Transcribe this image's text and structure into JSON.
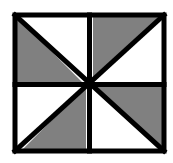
{
  "figure": {
    "name": "pinwheel-square",
    "title": "",
    "caption": "",
    "colors": {
      "shaded": "#808080",
      "unshaded": "#ffffff",
      "stroke": "#000000",
      "background": "#ffffff"
    },
    "geometry": {
      "outer_square": {
        "left": 15,
        "top": 15,
        "right": 164,
        "bottom": 151
      },
      "center": {
        "x": 89.5,
        "y": 83
      },
      "stroke_width": 5,
      "outer_stroke_width": 5
    },
    "quadrants": [
      {
        "id": "top-left",
        "diagonal": "top-left-to-bottom-right",
        "shaded_triangle": "lower-left",
        "unshaded_triangle": "upper-right"
      },
      {
        "id": "top-right",
        "diagonal": "top-right-to-bottom-left",
        "shaded_triangle": "upper-left",
        "unshaded_triangle": "lower-right"
      },
      {
        "id": "bottom-left",
        "diagonal": "top-right-to-bottom-left",
        "shaded_triangle": "lower-right",
        "unshaded_triangle": "upper-left"
      },
      {
        "id": "bottom-right",
        "diagonal": "top-left-to-bottom-right",
        "shaded_triangle": "upper-right",
        "unshaded_triangle": "lower-left"
      }
    ],
    "triangles": [
      {
        "id": "tri-tl-shaded",
        "points": "15,15 15,83 83,83",
        "fill_key": "shaded"
      },
      {
        "id": "tri-tl-unshaded",
        "points": "15,15 86,15 86,81",
        "fill_key": "unshaded"
      },
      {
        "id": "tri-tr-shaded",
        "points": "93,15 164,15 93,83",
        "fill_key": "shaded"
      },
      {
        "id": "tri-tr-unshaded",
        "points": "164,18 164,83 99,83",
        "fill_key": "unshaded"
      },
      {
        "id": "tri-bl-shaded",
        "points": "86,86 86,151 21,151",
        "fill_key": "shaded"
      },
      {
        "id": "tri-bl-unshaded",
        "points": "15,86 83,86 15,151",
        "fill_key": "unshaded"
      },
      {
        "id": "tri-br-shaded",
        "points": "93,86 164,86 164,151",
        "fill_key": "shaded"
      },
      {
        "id": "tri-br-unshaded",
        "points": "93,89 158,151 93,151",
        "fill_key": "unshaded"
      }
    ],
    "lines": [
      {
        "id": "divider-horizontal",
        "x1": 15,
        "y1": 84.5,
        "x2": 164,
        "y2": 84.5
      },
      {
        "id": "divider-vertical",
        "x1": 89.5,
        "y1": 15,
        "x2": 89.5,
        "y2": 151
      },
      {
        "id": "diagonal-main",
        "x1": 15,
        "y1": 15,
        "x2": 164,
        "y2": 151
      },
      {
        "id": "diagonal-anti",
        "x1": 164,
        "y1": 15,
        "x2": 15,
        "y2": 151
      }
    ]
  }
}
